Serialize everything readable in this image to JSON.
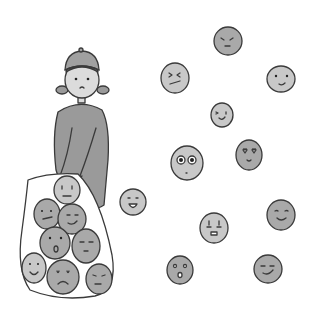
{
  "illustration": {
    "background": "#ffffff",
    "colors": {
      "outline": "#3a3a3a",
      "face_fill_light": "#c8c8c8",
      "face_fill_mid": "#a9a9a9",
      "clothing": "#9a9a9a",
      "skin": "#dcdcdc",
      "hat": "#a0a0a0",
      "bag": "#ffffff"
    },
    "girl": {
      "description": "Girl with bun hat and pigtails holding a net bag full of faces"
    },
    "bag_faces": [
      {
        "id": "bag-face-worried",
        "expression": "worried"
      },
      {
        "id": "bag-face-annoyed",
        "expression": "annoyed"
      },
      {
        "id": "bag-face-smirk",
        "expression": "smirk"
      },
      {
        "id": "bag-face-surprised",
        "expression": "surprised"
      },
      {
        "id": "bag-face-content",
        "expression": "content"
      },
      {
        "id": "bag-face-smile",
        "expression": "smile"
      },
      {
        "id": "bag-face-sad",
        "expression": "sad"
      },
      {
        "id": "bag-face-grumpy",
        "expression": "grumpy"
      }
    ],
    "floating_faces": [
      {
        "id": "face-angry",
        "expression": "angry"
      },
      {
        "id": "face-confused",
        "expression": "confused"
      },
      {
        "id": "face-smile",
        "expression": "smile"
      },
      {
        "id": "face-wink",
        "expression": "wink"
      },
      {
        "id": "face-big-eyes",
        "expression": "big-eyes"
      },
      {
        "id": "face-love",
        "expression": "heart-eyes"
      },
      {
        "id": "face-laugh",
        "expression": "laughing"
      },
      {
        "id": "face-scared",
        "expression": "scared"
      },
      {
        "id": "face-happy",
        "expression": "happy"
      },
      {
        "id": "face-shocked",
        "expression": "shocked"
      },
      {
        "id": "face-smug",
        "expression": "smug"
      }
    ]
  }
}
